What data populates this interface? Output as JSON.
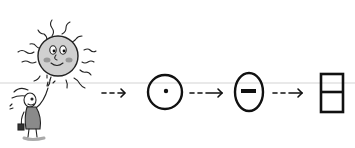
{
  "figure": {
    "description": "Sketch diagram: a cartoon sun and a small figure pointing up, followed by a sequence of symbols connected by dashed arrows",
    "scene": {
      "sun": {
        "name": "smiling-sun",
        "face": "smiling with cheeks"
      },
      "character": {
        "name": "rabbit-figure",
        "pose": "pointing at sun"
      }
    },
    "sequence": [
      {
        "id": "circle-dot",
        "label": "circle with dot"
      },
      {
        "id": "oval-bar",
        "label": "oval with horizontal bar"
      },
      {
        "id": "split-rectangle",
        "label": "rectangle divided horizontally"
      }
    ],
    "connector": {
      "style": "dashed-arrow",
      "count": 3
    },
    "colors": {
      "ink": "#111111",
      "sun_fill": "#cfcfcf",
      "cheek": "#9a9a9a",
      "background": "#ffffff",
      "guide_line": "#e4e4e4"
    }
  }
}
